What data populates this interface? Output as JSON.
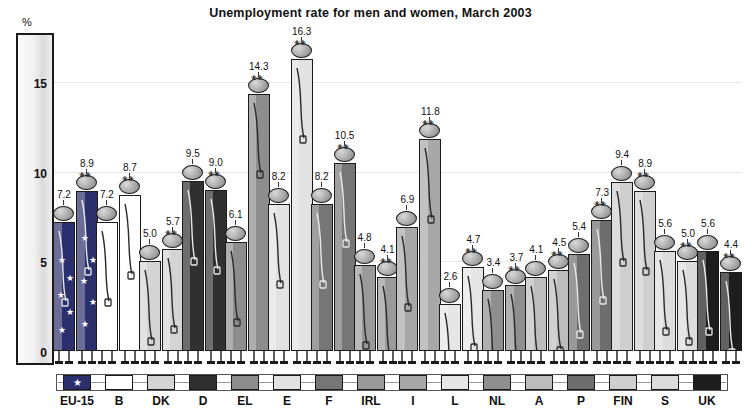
{
  "chart_data": {
    "type": "bar",
    "title": "Unemployment rate for men and women, March 2003",
    "ylabel": "%",
    "xlabel": "",
    "ylim": [
      0,
      17.5
    ],
    "yticks": [
      0,
      5,
      10,
      15
    ],
    "grid": true,
    "legend_position": "bottom",
    "categories": [
      "EU-15",
      "B",
      "DK",
      "D",
      "EL",
      "E",
      "F",
      "IRL",
      "I",
      "L",
      "NL",
      "A",
      "P",
      "FIN",
      "S",
      "UK"
    ],
    "series": [
      {
        "name": "men",
        "values": [
          7.2,
          7.2,
          5.0,
          9.5,
          6.1,
          8.2,
          8.2,
          4.8,
          6.9,
          2.6,
          3.4,
          4.1,
          5.4,
          9.4,
          5.6,
          5.6
        ]
      },
      {
        "name": "women",
        "values": [
          8.9,
          8.7,
          5.7,
          9.0,
          14.3,
          16.3,
          10.5,
          4.1,
          11.8,
          4.7,
          3.7,
          4.5,
          7.3,
          8.9,
          5.0,
          4.4
        ]
      }
    ],
    "category_colors": [
      "#2b2f6b",
      "#ffffff",
      "#d4d4d4",
      "#303030",
      "#8d8d8d",
      "#e2e2e2",
      "#767676",
      "#9a9a9a",
      "#a8a8a8",
      "#e6e6e6",
      "#8f8f8f",
      "#bdbdbd",
      "#6e6e6e",
      "#cfcfcf",
      "#dcdcdc",
      "#1d1d1d"
    ]
  },
  "legend": {
    "items": [
      {
        "label": "EU-15",
        "color": "#2b2f6b"
      },
      {
        "label": "B",
        "color": "#ffffff"
      },
      {
        "label": "DK",
        "color": "#d4d4d4"
      },
      {
        "label": "D",
        "color": "#303030"
      },
      {
        "label": "EL",
        "color": "#8d8d8d"
      },
      {
        "label": "E",
        "color": "#e2e2e2"
      },
      {
        "label": "F",
        "color": "#767676"
      },
      {
        "label": "IRL",
        "color": "#9a9a9a"
      },
      {
        "label": "I",
        "color": "#a8a8a8"
      },
      {
        "label": "L",
        "color": "#e6e6e6"
      },
      {
        "label": "NL",
        "color": "#8f8f8f"
      },
      {
        "label": "A",
        "color": "#bdbdbd"
      },
      {
        "label": "P",
        "color": "#6e6e6e"
      },
      {
        "label": "FIN",
        "color": "#cfcfcf"
      },
      {
        "label": "S",
        "color": "#dcdcdc"
      },
      {
        "label": "UK",
        "color": "#1d1d1d"
      }
    ]
  }
}
